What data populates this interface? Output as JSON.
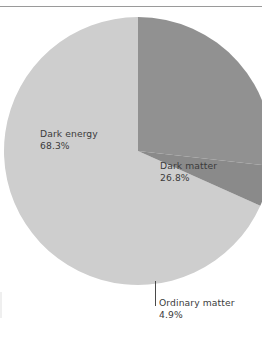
{
  "figure": {
    "background_color": "#ffffff",
    "width": 262,
    "height": 346,
    "rule_color": "#9a9a9a"
  },
  "chart_data": {
    "type": "pie",
    "title": "",
    "subtitle": "",
    "xlabel": "",
    "ylabel": "",
    "legend_position": "none",
    "grid": false,
    "labels_inline": true,
    "value_unit": "%",
    "start_angle_deg": 0,
    "direction": "clockwise",
    "center": {
      "x": 138,
      "y": 151
    },
    "radius": 134,
    "categories": [
      "Dark matter",
      "Ordinary matter",
      "Dark energy"
    ],
    "values": [
      26.8,
      4.9,
      68.3
    ],
    "slices": [
      {
        "name": "Dark matter",
        "value": 26.8,
        "value_text": "26.8%",
        "color": "#919191",
        "start_angle_deg": 0.0,
        "end_angle_deg": 96.48,
        "label_position": "inside-right"
      },
      {
        "name": "Ordinary matter",
        "value": 4.9,
        "value_text": "4.9%",
        "color": "#8a8a8a",
        "start_angle_deg": 96.48,
        "end_angle_deg": 114.12,
        "label_position": "outside-bottom",
        "has_leader_line": true
      },
      {
        "name": "Dark energy",
        "value": 68.3,
        "value_text": "68.3%",
        "color": "#cecece",
        "start_angle_deg": 114.12,
        "end_angle_deg": 360.0,
        "label_position": "inside-left"
      }
    ]
  },
  "labels": {
    "dark_energy": {
      "name": "Dark energy",
      "value": "68.3%"
    },
    "dark_matter": {
      "name": "Dark matter",
      "value": "26.8%"
    },
    "ordinary_matter": {
      "name": "Ordinary matter",
      "value": "4.9%"
    }
  },
  "colors": {
    "dark_energy": "#cecece",
    "dark_matter": "#919191",
    "ordinary_matter": "#8a8a8a",
    "text": "#3b3b3b",
    "leader_line": "#4a4a4a"
  }
}
